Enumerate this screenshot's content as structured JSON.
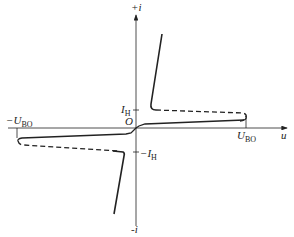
{
  "diagram": {
    "type": "I-V characteristic (bidirectional thyristor / TRIAC)",
    "axes": {
      "x_label": "u",
      "y_pos_label": "+i",
      "y_neg_label": "-i",
      "origin_label": "O"
    },
    "markers": {
      "breakover_pos": {
        "main": "U",
        "sub": "BO"
      },
      "breakover_neg": {
        "main": "−U",
        "sub": "BO"
      },
      "holding_pos": {
        "main": "I",
        "sub": "H"
      },
      "holding_neg": {
        "main": "−I",
        "sub": "H"
      }
    },
    "colors": {
      "line": "#222222",
      "background": "#ffffff"
    }
  }
}
